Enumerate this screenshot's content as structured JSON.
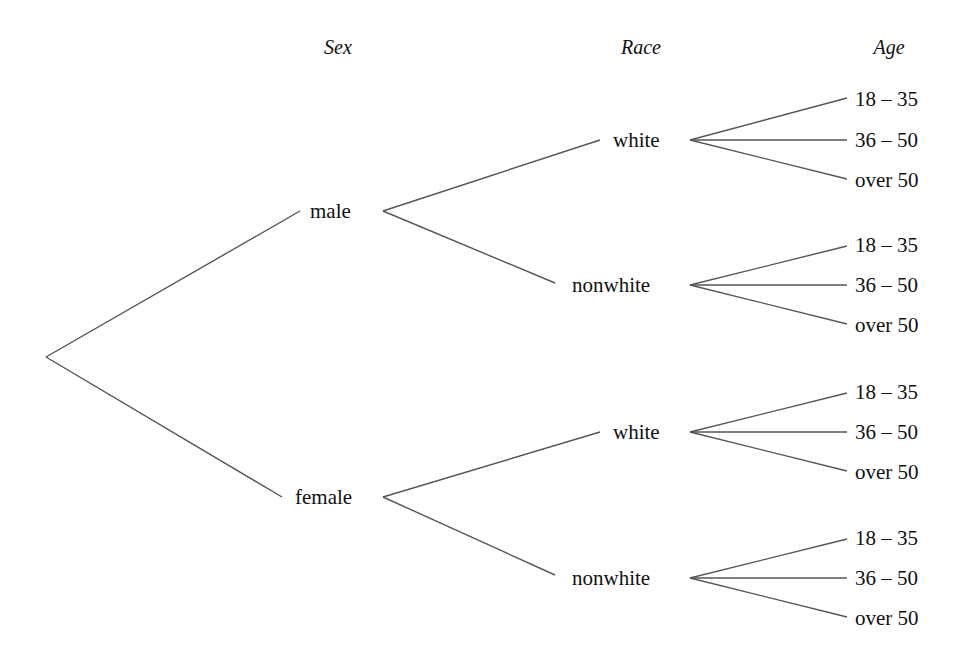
{
  "headers": {
    "sex": "Sex",
    "race": "Race",
    "age": "Age"
  },
  "tree": {
    "sex": [
      {
        "label": "male",
        "race": [
          {
            "label": "white",
            "ages": [
              "18 – 35",
              "36 – 50",
              "over 50"
            ]
          },
          {
            "label": "nonwhite",
            "ages": [
              "18 – 35",
              "36 – 50",
              "over 50"
            ]
          }
        ]
      },
      {
        "label": "female",
        "race": [
          {
            "label": "white",
            "ages": [
              "18 – 35",
              "36 – 50",
              "over 50"
            ]
          },
          {
            "label": "nonwhite",
            "ages": [
              "18 – 35",
              "36 – 50",
              "over 50"
            ]
          }
        ]
      }
    ]
  },
  "colors": {
    "line": "#555555",
    "text": "#111111",
    "background": "#ffffff"
  }
}
